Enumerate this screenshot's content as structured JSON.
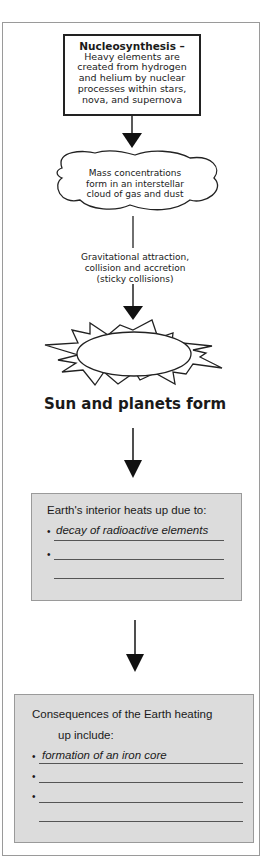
{
  "nucleosynthesis": {
    "title": "Nucleosynthesis –",
    "lines": [
      "Heavy elements are",
      "created from hydrogen",
      "and helium by nuclear",
      "processes within stars,",
      "nova, and supernova"
    ]
  },
  "cloud": {
    "lines": [
      "Mass concentrations",
      "form in an interstellar",
      "cloud of gas and dust"
    ]
  },
  "gravitation": {
    "lines": [
      "Gravitational attraction,",
      "collision and accretion",
      "(sticky collisions)"
    ]
  },
  "sun": {
    "label": "Sun and planets form"
  },
  "interior_box": {
    "title": "Earth's interior heats up due to:",
    "bullets": [
      "decay of radioactive elements",
      "",
      ""
    ]
  },
  "consequences_box": {
    "title_line1": "Consequences of the Earth heating",
    "title_line2": "up include:",
    "bullets": [
      "formation of an iron core",
      "",
      "",
      ""
    ]
  },
  "glyphs": {
    "bullet": "•"
  },
  "colors": {
    "box_fill": "#dcdcdc",
    "frame": "#9a9a9a",
    "ink": "#1a1a1a"
  }
}
